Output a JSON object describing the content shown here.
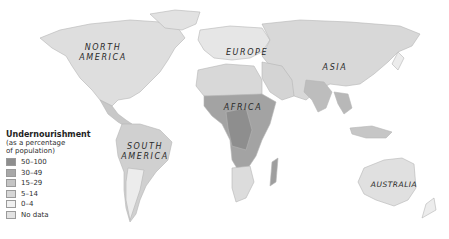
{
  "map": {
    "colors": {
      "50-100": "#8e8e8e",
      "30-49": "#a8a8a8",
      "15-29": "#c4c4c4",
      "5-14": "#d6d6d6",
      "0-4": "#ececec",
      "no_data": "#e2e2e2",
      "ocean": "#ffffff",
      "border": "#b5b5b5"
    },
    "regions": [
      {
        "id": "north-america",
        "label_line1": "NORTH",
        "label_line2": "AMERICA"
      },
      {
        "id": "south-america",
        "label_line1": "SOUTH",
        "label_line2": "AMERICA"
      },
      {
        "id": "europe",
        "label_line1": "EUROPE",
        "label_line2": ""
      },
      {
        "id": "asia",
        "label_line1": "ASIA",
        "label_line2": ""
      },
      {
        "id": "africa",
        "label_line1": "AFRICA",
        "label_line2": ""
      },
      {
        "id": "australia",
        "label_line1": "AUSTRALIA",
        "label_line2": ""
      }
    ]
  },
  "legend": {
    "title": "Undernourishment",
    "subtitle_line1": "(as a percentage",
    "subtitle_line2": "of population)",
    "items": [
      {
        "label": "50–100",
        "color": "#8e8e8e"
      },
      {
        "label": "30–49",
        "color": "#a8a8a8"
      },
      {
        "label": "15–29",
        "color": "#c4c4c4"
      },
      {
        "label": "5–14",
        "color": "#d6d6d6"
      },
      {
        "label": "0–4",
        "color": "#f0f0f0"
      },
      {
        "label": "No data",
        "color": "#e2e2e2"
      }
    ]
  }
}
